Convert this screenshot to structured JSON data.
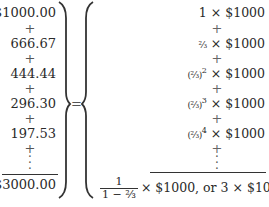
{
  "left_column": {
    "terms": [
      "$1000.00",
      "666.67",
      "444.44",
      "296.30",
      "197.53"
    ],
    "operator": "+",
    "continuation": "⋮",
    "total": "$3000.00"
  },
  "equals": "=",
  "right_column": {
    "terms": [
      {
        "coef": "1",
        "times": "×",
        "amount": "$1000"
      },
      {
        "coef": "⅔",
        "times": "×",
        "amount": "$1000"
      },
      {
        "coef": "(⅔)",
        "exp": "2",
        "times": "×",
        "amount": "$1000"
      },
      {
        "coef": "(⅔)",
        "exp": "3",
        "times": "×",
        "amount": "$1000"
      },
      {
        "coef": "(⅔)",
        "exp": "4",
        "times": "×",
        "amount": "$1000"
      }
    ],
    "operator": "+",
    "continuation": "⋮",
    "final": {
      "numerator": "1",
      "denominator": "1 − ⅔",
      "times": "×",
      "amount": "$1000,",
      "or_text": "or",
      "alt": "3 × $1000"
    }
  },
  "colors": {
    "text": "#2a2a2a",
    "rule": "#333333"
  }
}
